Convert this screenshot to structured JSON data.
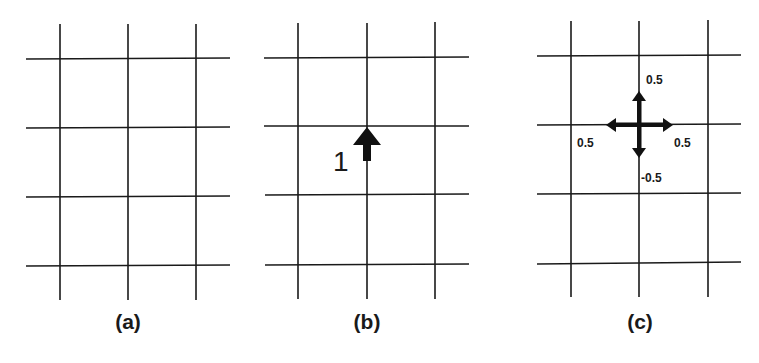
{
  "figure": {
    "line_color": "#1a1a1a",
    "background": "#ffffff",
    "panels": [
      {
        "id": "a",
        "caption": "(a)",
        "grid": {
          "columns_x": [
            60,
            128,
            196
          ],
          "rows_y": [
            59,
            128,
            197,
            265
          ],
          "v_span": [
            24,
            300
          ],
          "h_span": [
            26,
            230
          ]
        }
      },
      {
        "id": "b",
        "caption": "(b)",
        "grid": {
          "columns_x": [
            298,
            367,
            435
          ],
          "rows_y": [
            58,
            126,
            195,
            264
          ],
          "v_span": [
            23,
            299
          ],
          "h_span": [
            264,
            469
          ]
        },
        "arrow": {
          "direction": "up",
          "magnitude_label": "1"
        }
      },
      {
        "id": "c",
        "caption": "(c)",
        "grid": {
          "columns_x": [
            571,
            639,
            708
          ],
          "rows_y": [
            56,
            125,
            193,
            262
          ],
          "v_span": [
            21,
            297
          ],
          "h_span": [
            537,
            741
          ]
        },
        "arrows": [
          {
            "direction": "up",
            "label": "0.5"
          },
          {
            "direction": "left",
            "label": "0.5"
          },
          {
            "direction": "right",
            "label": "0.5"
          },
          {
            "direction": "down",
            "label": "-0.5"
          }
        ]
      }
    ]
  }
}
